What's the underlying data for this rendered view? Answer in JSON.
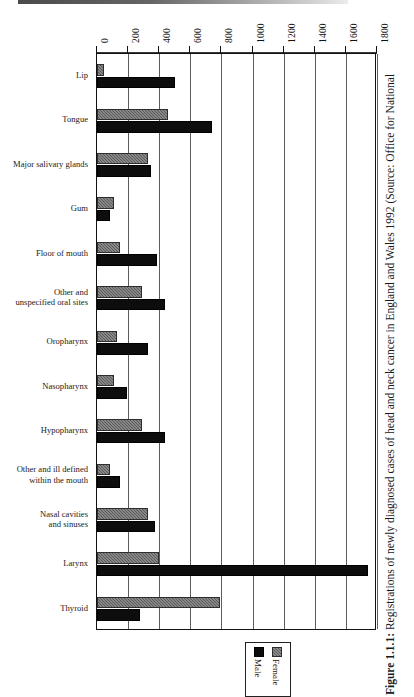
{
  "figure": {
    "label": "Figure 1.1.1:",
    "caption": "Registrations of newly diagnosed cases of head and neck cancer in England and Wales 1992 (Source: Office for National"
  },
  "legend": {
    "position": "bottom-center",
    "entries": [
      {
        "name": "female-legend-entry",
        "label": "Female",
        "color": "#595959"
      },
      {
        "name": "male-legend-entry",
        "label": "Male",
        "color": "#0d0d0d"
      }
    ]
  },
  "chart_data": {
    "type": "bar",
    "orientation": "horizontal",
    "title": "",
    "xlabel": "",
    "ylabel": "",
    "xlim": [
      0,
      1800
    ],
    "xticks": [
      0,
      200,
      400,
      600,
      800,
      1000,
      1200,
      1400,
      1600,
      1800
    ],
    "xtick_labels": [
      "0",
      "200",
      "400",
      "600",
      "800",
      "1000",
      "1200",
      "1400",
      "1600",
      "1800"
    ],
    "grid": true,
    "grid_axis": "x",
    "categories": [
      "Lip",
      "Tongue",
      "Major salivary glands",
      "Gum",
      "Floor of mouth",
      "Other and\nunspecified oral sites",
      "Oropharynx",
      "Nasopharynx",
      "Hypopharynx",
      "Other and ill defined\nwithin the mouth",
      "Nasal cavities\nand sinuses",
      "Larynx",
      "Thyroid"
    ],
    "series": [
      {
        "name": "Female",
        "color": "#595959",
        "values": [
          45,
          455,
          325,
          110,
          145,
          290,
          130,
          110,
          290,
          85,
          330,
          400,
          790
        ]
      },
      {
        "name": "Male",
        "color": "#0d0d0d",
        "values": [
          500,
          740,
          350,
          85,
          385,
          440,
          330,
          190,
          440,
          150,
          375,
          1745,
          275
        ]
      }
    ]
  }
}
